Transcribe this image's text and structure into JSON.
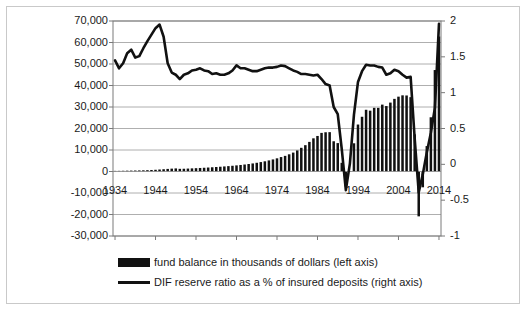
{
  "chart_data": {
    "type": "bar",
    "title": "",
    "subtitle": "",
    "xlabel": "",
    "ylabel": "",
    "y2label": "",
    "grid": true,
    "legend_position": "bottom-left",
    "x": [
      1934,
      1935,
      1936,
      1937,
      1938,
      1939,
      1940,
      1941,
      1942,
      1943,
      1944,
      1945,
      1946,
      1947,
      1948,
      1949,
      1950,
      1951,
      1952,
      1953,
      1954,
      1955,
      1956,
      1957,
      1958,
      1959,
      1960,
      1961,
      1962,
      1963,
      1964,
      1965,
      1966,
      1967,
      1968,
      1969,
      1970,
      1971,
      1972,
      1973,
      1974,
      1975,
      1976,
      1977,
      1978,
      1979,
      1980,
      1981,
      1982,
      1983,
      1984,
      1985,
      1986,
      1987,
      1988,
      1989,
      1990,
      1991,
      1992,
      1993,
      1994,
      1995,
      1996,
      1997,
      1998,
      1999,
      2000,
      2001,
      2002,
      2003,
      2004,
      2005,
      2006,
      2007,
      2008,
      2009,
      2010,
      2011,
      2012,
      2013,
      2014
    ],
    "xticks": [
      1934,
      1944,
      1954,
      1964,
      1974,
      1984,
      1994,
      2004,
      2014
    ],
    "ylim": [
      -30000,
      70000
    ],
    "yticks": [
      -30000,
      -20000,
      -10000,
      0,
      10000,
      20000,
      30000,
      40000,
      50000,
      60000,
      70000
    ],
    "ytick_labels": [
      "-30,000",
      "-20,000",
      "-10,000",
      "0",
      "10,000",
      "20,000",
      "30,000",
      "40,000",
      "50,000",
      "60,000",
      "70,000"
    ],
    "y2lim": [
      -1,
      2
    ],
    "y2ticks": [
      -1,
      -0.5,
      0,
      0.5,
      1,
      1.5,
      2
    ],
    "y2tick_labels": [
      "-1",
      "-0.5",
      "0",
      "0.5",
      "1",
      "1.5",
      "2"
    ],
    "series": [
      {
        "name": "fund balance in thousands of dollars (left axis)",
        "type": "bar",
        "axis": "left",
        "color": "#111111",
        "values": [
          291,
          306,
          343,
          383,
          420,
          452,
          496,
          553,
          616,
          703,
          804,
          929,
          1059,
          1204,
          1332,
          1436,
          1244,
          1282,
          1364,
          1451,
          1543,
          1640,
          1742,
          1851,
          1965,
          2090,
          2222,
          2353,
          2502,
          2668,
          2845,
          3036,
          3252,
          3485,
          3749,
          4051,
          4380,
          4740,
          5159,
          5615,
          6124,
          6716,
          7269,
          7993,
          8796,
          9793,
          11020,
          12246,
          13771,
          15429,
          16529,
          17957,
          18253,
          18302,
          14061,
          13210,
          4045,
          -6934,
          178,
          13122,
          21848,
          25453,
          28710,
          28293,
          29612,
          29596,
          31106,
          30439,
          32050,
          33783,
          34812,
          35426,
          35361,
          34583,
          17276,
          -20862,
          -7352,
          11827,
          25224,
          47190,
          62780
        ],
        "values_unit": "thousands of dollars"
      },
      {
        "name": "DIF reserve ratio as a % of insured deposits (right axis)",
        "type": "line",
        "axis": "right",
        "color": "#111111",
        "values": [
          1.45,
          1.34,
          1.41,
          1.55,
          1.6,
          1.49,
          1.51,
          1.62,
          1.72,
          1.81,
          1.9,
          1.95,
          1.78,
          1.41,
          1.28,
          1.25,
          1.19,
          1.25,
          1.27,
          1.31,
          1.32,
          1.34,
          1.31,
          1.3,
          1.26,
          1.27,
          1.25,
          1.25,
          1.27,
          1.31,
          1.38,
          1.34,
          1.34,
          1.32,
          1.3,
          1.3,
          1.32,
          1.34,
          1.35,
          1.35,
          1.36,
          1.38,
          1.37,
          1.34,
          1.31,
          1.29,
          1.26,
          1.26,
          1.25,
          1.24,
          1.25,
          1.19,
          1.12,
          1.1,
          0.8,
          0.7,
          0.21,
          -0.36,
          0.01,
          0.69,
          1.15,
          1.3,
          1.39,
          1.38,
          1.38,
          1.36,
          1.35,
          1.25,
          1.27,
          1.32,
          1.3,
          1.25,
          1.21,
          1.22,
          0.36,
          -0.39,
          -0.14,
          0.17,
          0.44,
          0.79,
          1.96
        ],
        "values_unit": "percent"
      }
    ]
  },
  "axes": {
    "left_ticks": [
      "70,000",
      "60,000",
      "50,000",
      "40,000",
      "30,000",
      "20,000",
      "10,000",
      "0",
      "-10,000",
      "-20,000",
      "-30,000"
    ],
    "right_ticks": [
      "2",
      "1.5",
      "1",
      "0.5",
      "0",
      "-0.5",
      "-1"
    ],
    "x_ticks": [
      "1934",
      "1944",
      "1954",
      "1964",
      "1974",
      "1984",
      "1994",
      "2004",
      "2014"
    ]
  },
  "legend": {
    "items": [
      {
        "marker": "bar-swatch",
        "label": "fund balance in thousands of dollars (left axis)"
      },
      {
        "marker": "line-swatch",
        "label": "DIF reserve ratio as a % of insured deposits (right axis)"
      }
    ]
  },
  "colors": {
    "series": "#111111",
    "grid": "#9a9a9a",
    "axis": "#7a7a7a",
    "border": "#c9c9c9",
    "text": "#1a1a1a",
    "background": "#ffffff"
  }
}
